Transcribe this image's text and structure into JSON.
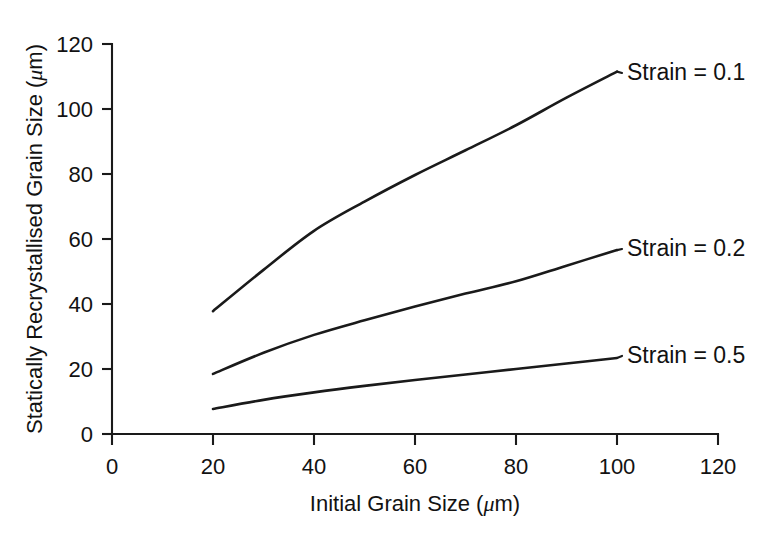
{
  "chart_data": {
    "type": "line",
    "title": "",
    "subtitle": "",
    "xlabel_text": "Initial Grain Size (",
    "xlabel_unit": "m)",
    "xlabel_full": "Initial Grain Size (μm)",
    "ylabel_text": "Statically Recrystallised Grain Size (",
    "ylabel_unit": "m)",
    "ylabel_full": "Statically Recrystallised Grain Size (μm)",
    "mu_glyph": "μ",
    "xlim": [
      0,
      120
    ],
    "ylim": [
      0,
      120
    ],
    "xticks": [
      0,
      20,
      40,
      60,
      80,
      100,
      120
    ],
    "xtick_labels": [
      "0",
      "20",
      "40",
      "60",
      "80",
      "100",
      "120"
    ],
    "yticks": [
      0,
      20,
      40,
      60,
      80,
      100,
      120
    ],
    "ytick_labels": [
      "0",
      "20",
      "40",
      "60",
      "80",
      "100",
      "120"
    ],
    "grid": false,
    "legend_position": "inline-right-annotations",
    "x": [
      20,
      30,
      40,
      50,
      60,
      70,
      80,
      90,
      100
    ],
    "series": [
      {
        "name": "Strain = 0.1",
        "label": "Strain = 0.1",
        "values": [
          37.8,
          50.5,
          62.5,
          71.5,
          79.7,
          87.3,
          95.0,
          103.5,
          111.5
        ],
        "color": "#1a1a1a"
      },
      {
        "name": "Strain = 0.2",
        "label": "Strain = 0.2",
        "values": [
          18.5,
          25.0,
          30.5,
          35.0,
          39.2,
          43.2,
          47.0,
          51.8,
          56.6
        ],
        "color": "#1a1a1a"
      },
      {
        "name": "Strain = 0.5",
        "label": "Strain = 0.5",
        "values": [
          7.7,
          10.5,
          12.8,
          14.8,
          16.6,
          18.3,
          20.0,
          21.7,
          23.4
        ],
        "color": "#1a1a1a"
      }
    ],
    "annotations": [
      {
        "label": "Strain = 0.1",
        "at_x": 100,
        "at_y": 111.5
      },
      {
        "label": "Strain = 0.2",
        "at_x": 100,
        "at_y": 56.6
      },
      {
        "label": "Strain = 0.5",
        "at_x": 100,
        "at_y": 23.4
      }
    ],
    "axis_color": "#1a1a1a",
    "background_color": "#ffffff"
  }
}
